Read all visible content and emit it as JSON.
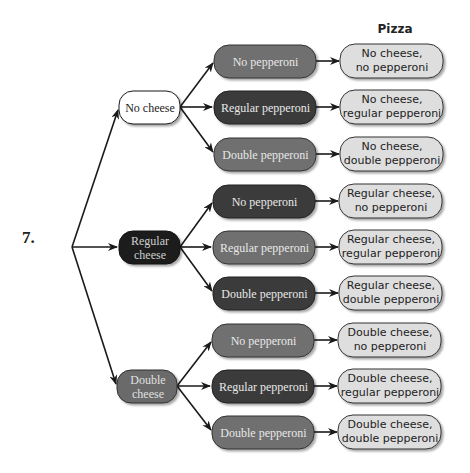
{
  "problem_number": "7.",
  "header": {
    "pizza": "Pizza"
  },
  "colors": {
    "white_box": "#ffffff",
    "black_box": "#1e1e1e",
    "dark_box": "#3a3a3a",
    "medium_box": "#6e6e6e",
    "light_box": "#dedede",
    "line": "#1a1a1a"
  },
  "root": {
    "label": ""
  },
  "cheese": [
    {
      "label": "No cheese",
      "style": "white"
    },
    {
      "label": "Regular\ncheese",
      "style": "black"
    },
    {
      "label": "Double\ncheese",
      "style": "medium"
    }
  ],
  "pepperoni": [
    {
      "label": "No pepperoni",
      "style": "medium"
    },
    {
      "label": "Regular pepperoni",
      "style": "dark"
    },
    {
      "label": "Double pepperoni",
      "style": "medium"
    },
    {
      "label": "No pepperoni",
      "style": "dark"
    },
    {
      "label": "Regular pepperoni",
      "style": "medium"
    },
    {
      "label": "Double pepperoni",
      "style": "dark"
    },
    {
      "label": "No pepperoni",
      "style": "medium"
    },
    {
      "label": "Regular pepperoni",
      "style": "dark"
    },
    {
      "label": "Double pepperoni",
      "style": "medium"
    }
  ],
  "pizzas": [
    {
      "label": "No cheese,\nno pepperoni"
    },
    {
      "label": "No cheese,\nregular pepperoni"
    },
    {
      "label": "No cheese,\ndouble pepperoni"
    },
    {
      "label": "Regular cheese,\nno pepperoni"
    },
    {
      "label": "Regular cheese,\nregular pepperoni"
    },
    {
      "label": "Regular cheese,\ndouble pepperoni"
    },
    {
      "label": "Double cheese,\nno pepperoni"
    },
    {
      "label": "Double cheese,\nregular pepperoni"
    },
    {
      "label": "Double cheese,\ndouble pepperoni"
    }
  ]
}
